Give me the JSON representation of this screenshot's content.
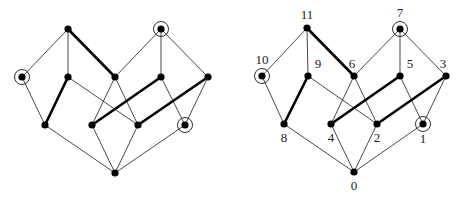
{
  "diagram": {
    "title": "",
    "style": {
      "thin_edge_color": "#1a1a1a",
      "thick_edge_color": "#000000",
      "node_color": "#000000",
      "background": "#ffffff"
    },
    "graphs": [
      {
        "id": "unlabeled",
        "labels_visible": false,
        "nodes": [
          {
            "id": "0",
            "x": 115,
            "y": 173,
            "circled": false
          },
          {
            "id": "1",
            "x": 185,
            "y": 125,
            "circled": true
          },
          {
            "id": "2",
            "x": 138,
            "y": 125,
            "circled": false
          },
          {
            "id": "3",
            "x": 208,
            "y": 77,
            "circled": false
          },
          {
            "id": "4",
            "x": 92,
            "y": 125,
            "circled": false
          },
          {
            "id": "5",
            "x": 161,
            "y": 77,
            "circled": false
          },
          {
            "id": "6",
            "x": 115,
            "y": 77,
            "circled": false
          },
          {
            "id": "7",
            "x": 161,
            "y": 29,
            "circled": true
          },
          {
            "id": "8",
            "x": 45,
            "y": 125,
            "circled": false
          },
          {
            "id": "9",
            "x": 68,
            "y": 77,
            "circled": false
          },
          {
            "id": "10",
            "x": 22,
            "y": 77,
            "circled": true
          },
          {
            "id": "11",
            "x": 68,
            "y": 29,
            "circled": false
          }
        ]
      },
      {
        "id": "labeled",
        "labels_visible": true,
        "nodes": [
          {
            "id": "0",
            "label": "0",
            "x": 354,
            "y": 172,
            "circled": false,
            "label_dx": 0,
            "label_dy": 18
          },
          {
            "id": "1",
            "label": "1",
            "x": 423,
            "y": 124,
            "circled": true,
            "label_dx": 0,
            "label_dy": 19
          },
          {
            "id": "2",
            "label": "2",
            "x": 377,
            "y": 124,
            "circled": false,
            "label_dx": 0,
            "label_dy": 18
          },
          {
            "id": "3",
            "label": "3",
            "x": 446,
            "y": 76,
            "circled": false,
            "label_dx": -3,
            "label_dy": -8
          },
          {
            "id": "4",
            "label": "4",
            "x": 331,
            "y": 124,
            "circled": false,
            "label_dx": 0,
            "label_dy": 18
          },
          {
            "id": "5",
            "label": "5",
            "x": 400,
            "y": 76,
            "circled": false,
            "label_dx": 10,
            "label_dy": -8
          },
          {
            "id": "6",
            "label": "6",
            "x": 354,
            "y": 76,
            "circled": false,
            "label_dx": -2,
            "label_dy": -8
          },
          {
            "id": "7",
            "label": "7",
            "x": 400,
            "y": 29,
            "circled": true,
            "label_dx": 0,
            "label_dy": -12
          },
          {
            "id": "8",
            "label": "8",
            "x": 284,
            "y": 124,
            "circled": false,
            "label_dx": 0,
            "label_dy": 18
          },
          {
            "id": "9",
            "label": "9",
            "x": 308,
            "y": 76,
            "circled": false,
            "label_dx": 10,
            "label_dy": -8
          },
          {
            "id": "10",
            "label": "10",
            "x": 262,
            "y": 76,
            "circled": true,
            "label_dx": 0,
            "label_dy": -12
          },
          {
            "id": "11",
            "label": "11",
            "x": 307,
            "y": 28,
            "circled": false,
            "label_dx": 0,
            "label_dy": -9
          }
        ]
      }
    ],
    "edges": [
      {
        "from": "11",
        "to": "10",
        "weight": "thin"
      },
      {
        "from": "11",
        "to": "9",
        "weight": "thin"
      },
      {
        "from": "11",
        "to": "6",
        "weight": "thick"
      },
      {
        "from": "7",
        "to": "6",
        "weight": "thin"
      },
      {
        "from": "7",
        "to": "5",
        "weight": "thin"
      },
      {
        "from": "7",
        "to": "3",
        "weight": "thin"
      },
      {
        "from": "10",
        "to": "8",
        "weight": "thin"
      },
      {
        "from": "9",
        "to": "8",
        "weight": "thick"
      },
      {
        "from": "9",
        "to": "2",
        "weight": "thin"
      },
      {
        "from": "6",
        "to": "4",
        "weight": "thin"
      },
      {
        "from": "6",
        "to": "2",
        "weight": "thin"
      },
      {
        "from": "5",
        "to": "4",
        "weight": "thick"
      },
      {
        "from": "5",
        "to": "1",
        "weight": "thin"
      },
      {
        "from": "3",
        "to": "2",
        "weight": "thick"
      },
      {
        "from": "3",
        "to": "1",
        "weight": "thin"
      },
      {
        "from": "8",
        "to": "0",
        "weight": "thin"
      },
      {
        "from": "4",
        "to": "0",
        "weight": "thin"
      },
      {
        "from": "2",
        "to": "0",
        "weight": "thin"
      },
      {
        "from": "1",
        "to": "0",
        "weight": "thin"
      }
    ]
  }
}
